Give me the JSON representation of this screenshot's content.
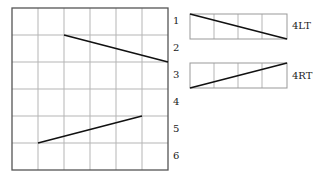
{
  "main_grid": {
    "columns": 6,
    "rows": 6,
    "row_labels": [
      "1",
      "2",
      "3",
      "4",
      "5",
      "6"
    ],
    "lines": [
      {
        "from": {
          "col": 2,
          "row_line": 1
        },
        "to": {
          "col": 6,
          "row_line": 2
        }
      },
      {
        "from": {
          "col": 1,
          "row_line": 5
        },
        "to": {
          "col": 5,
          "row_line": 4
        }
      }
    ]
  },
  "legend": [
    {
      "label": "4LT",
      "direction": "left-top to right-bottom",
      "cells": 4
    },
    {
      "label": "4RT",
      "direction": "left-bottom to right-top",
      "cells": 4
    }
  ],
  "colors": {
    "grid": "#b5b5b5",
    "border": "#555555",
    "line": "#111111",
    "text": "#222222"
  }
}
